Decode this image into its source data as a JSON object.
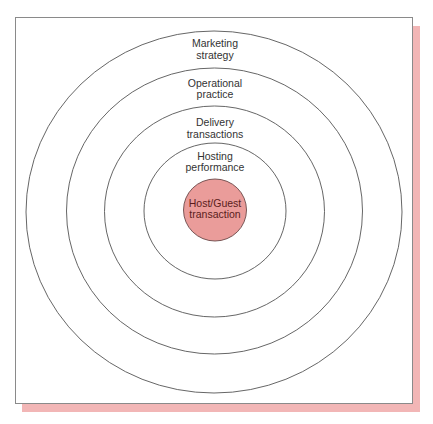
{
  "diagram": {
    "type": "concentric-circles",
    "colors": {
      "core_fill": "#ea9c9a",
      "core_text": "#5a1c1c",
      "shadow": "#f2b6b6",
      "ring_stroke": "#555555"
    },
    "core": {
      "lines": [
        "Host/Guest",
        "transaction"
      ]
    },
    "rings": [
      {
        "lines": [
          "Hosting",
          "performance"
        ]
      },
      {
        "lines": [
          "Delivery",
          "transactions"
        ]
      },
      {
        "lines": [
          "Operational",
          "practice"
        ]
      },
      {
        "lines": [
          "Marketing",
          "strategy"
        ]
      }
    ]
  }
}
